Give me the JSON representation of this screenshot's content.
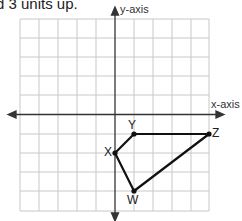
{
  "prompt": {
    "text": "d 3 units up."
  },
  "axes": {
    "x_label": "x-axis",
    "y_label": "y-axis"
  },
  "grid": {
    "columns": 10,
    "rows": 10,
    "x_range": [
      -5,
      5
    ],
    "y_range": [
      -5,
      5
    ]
  },
  "polygon": {
    "vertices": [
      {
        "label": "W",
        "x": 1,
        "y": -4
      },
      {
        "label": "X",
        "x": 0,
        "y": -2
      },
      {
        "label": "Y",
        "x": 1,
        "y": -1
      },
      {
        "label": "Z",
        "x": 5,
        "y": -1
      }
    ],
    "edges": [
      "W-X",
      "X-Y",
      "Y-Z",
      "Z-W"
    ]
  },
  "colors": {
    "grid": "#c8c8c8",
    "axis": "#333333",
    "polygon": "#111111"
  }
}
